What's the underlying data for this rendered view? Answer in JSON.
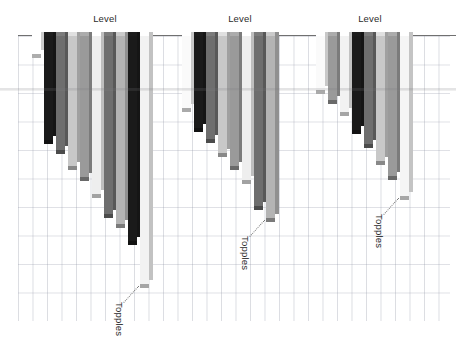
{
  "chart_data": {
    "type": "bar",
    "title": "",
    "xlabel": "Level",
    "ylabel": "Topples",
    "orientation": "hanging-down-from-top-axis",
    "style": "3d-column",
    "grid": true,
    "legend": null,
    "ylim": [
      0,
      285
    ],
    "group_label": "Level",
    "annotation_label": "Topples",
    "groups": [
      {
        "label": "Level",
        "label_x": 105,
        "annotation": "Topples",
        "bars": [
          {
            "color": "#ffffff",
            "value": 18,
            "x": 32
          },
          {
            "color": "#1a1a1a",
            "value": 104,
            "x": 44
          },
          {
            "color": "#6e6e6e",
            "value": 114,
            "x": 56
          },
          {
            "color": "#c8c8c8",
            "value": 130,
            "x": 68
          },
          {
            "color": "#9a9a9a",
            "value": 141,
            "x": 80
          },
          {
            "color": "#eeeeee",
            "value": 158,
            "x": 92
          },
          {
            "color": "#6e6e6e",
            "value": 178,
            "x": 104
          },
          {
            "color": "#b4b4b4",
            "value": 188,
            "x": 116
          },
          {
            "color": "#1a1a1a",
            "value": 205,
            "x": 128
          },
          {
            "color": "#f2f2f2",
            "value": 248,
            "x": 140
          }
        ]
      },
      {
        "label": "Level",
        "label_x": 240,
        "annotation": "Topples",
        "bars": [
          {
            "color": "#fafafa",
            "value": 72,
            "x": 182
          },
          {
            "color": "#1a1a1a",
            "value": 92,
            "x": 194
          },
          {
            "color": "#6e6e6e",
            "value": 103,
            "x": 206
          },
          {
            "color": "#c8c8c8",
            "value": 117,
            "x": 218
          },
          {
            "color": "#9a9a9a",
            "value": 130,
            "x": 230
          },
          {
            "color": "#eeeeee",
            "value": 144,
            "x": 242
          },
          {
            "color": "#6e6e6e",
            "value": 170,
            "x": 254
          },
          {
            "color": "#b4b4b4",
            "value": 182,
            "x": 266
          }
        ]
      },
      {
        "label": "Level",
        "label_x": 370,
        "annotation": "Topples",
        "bars": [
          {
            "color": "#fafafa",
            "value": 54,
            "x": 316
          },
          {
            "color": "#9a9a9a",
            "value": 64,
            "x": 328
          },
          {
            "color": "#f2f2f2",
            "value": 76,
            "x": 340
          },
          {
            "color": "#1a1a1a",
            "value": 94,
            "x": 352
          },
          {
            "color": "#6e6e6e",
            "value": 108,
            "x": 364
          },
          {
            "color": "#c8c8c8",
            "value": 125,
            "x": 376
          },
          {
            "color": "#9a9a9a",
            "value": 140,
            "x": 388
          },
          {
            "color": "#f5f5f5",
            "value": 160,
            "x": 400
          }
        ]
      }
    ]
  },
  "colors": {
    "axis": "#707070",
    "grid": "#969baa",
    "text": "#2b2b2b",
    "background": "#ffffff",
    "bar_side": "#b9b9b9",
    "leader_line": "#7a7a7a"
  },
  "labels": {
    "level": "Level",
    "topples": "Topples"
  }
}
